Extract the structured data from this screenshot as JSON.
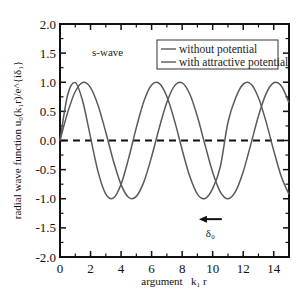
{
  "chart_data": {
    "type": "line",
    "title": "",
    "annotation_label": "s-wave",
    "xlabel": "argument   k₁ r",
    "ylabel": "radial wave function u₀(k₁r)/e^{iδ₁}",
    "xlim": [
      0,
      15
    ],
    "ylim": [
      -2.0,
      2.0
    ],
    "xticks": [
      0,
      2,
      4,
      6,
      8,
      10,
      12,
      14
    ],
    "xtick_labels": [
      "0",
      "2",
      "4",
      "6",
      "8",
      "10",
      "12",
      "14"
    ],
    "yticks": [
      -2.0,
      -1.5,
      -1.0,
      -0.5,
      0.0,
      0.5,
      1.0,
      1.5,
      2.0
    ],
    "ytick_labels": [
      "-2.0",
      "-1.5",
      "-1.0",
      "-0.5",
      "0.0",
      "0.5",
      "1.0",
      "1.5",
      "2.0"
    ],
    "grid": false,
    "legend_position": "upper right",
    "x": [
      0,
      0.5,
      1,
      1.5,
      2,
      2.5,
      3,
      3.5,
      4,
      4.5,
      5,
      5.5,
      6,
      6.5,
      7,
      7.5,
      8,
      8.5,
      9,
      9.5,
      10,
      10.5,
      11,
      11.5,
      12,
      12.5,
      13,
      13.5,
      14,
      14.5,
      15
    ],
    "series": [
      {
        "name": "without potential",
        "color": "#5a5a5a",
        "style": "solid",
        "values": [
          0,
          0.479,
          0.841,
          0.997,
          0.909,
          0.598,
          0.141,
          -0.351,
          -0.757,
          -0.978,
          -0.959,
          -0.706,
          -0.279,
          0.215,
          0.657,
          0.938,
          0.989,
          0.798,
          0.412,
          -0.075,
          -0.544,
          -0.88,
          -1.0,
          -0.875,
          -0.537,
          -0.066,
          0.42,
          0.804,
          0.991,
          0.935,
          0.65
        ]
      },
      {
        "name": "with attractive potential",
        "color": "#5a5a5a",
        "style": "solid",
        "values": [
          0,
          0.78,
          0.993,
          0.662,
          0.055,
          -0.543,
          -0.921,
          -0.986,
          -0.75,
          -0.303,
          0.221,
          0.679,
          0.953,
          0.979,
          0.754,
          0.341,
          -0.158,
          -0.615,
          -0.92,
          -0.995,
          -0.826,
          -0.45,
          0.309,
          0.728,
          0.968,
          0.97,
          0.735,
          0.32,
          -0.173,
          -0.623,
          -0.924
        ]
      }
    ],
    "reference_line": {
      "y": 0.0,
      "style": "dashed",
      "color": "#111111"
    },
    "phase_shift_annotation": {
      "label": "δ₀",
      "arrow_direction": "left",
      "arrow_from_x": 10.6,
      "arrow_to_x": 9.1,
      "y": -1.35
    }
  }
}
